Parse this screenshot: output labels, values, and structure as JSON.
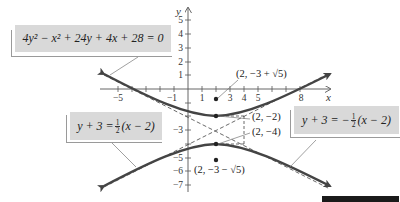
{
  "diagram": {
    "type": "hyperbola-graph",
    "equation": "4y² − x² + 24y + 4x + 28 = 0",
    "axes": {
      "x_label": "x",
      "y_label": "y",
      "x_ticks": [
        "−5",
        "−1",
        "1",
        "3",
        "4",
        "5",
        "8"
      ],
      "y_ticks": [
        "5",
        "4",
        "3",
        "2",
        "1",
        "−3",
        "−5",
        "−6",
        "−7"
      ]
    },
    "center": [
      2,
      -3
    ],
    "vertices": [
      {
        "label": "(2, −2)",
        "x": 2,
        "y": -2
      },
      {
        "label": "(2, −4)",
        "x": 2,
        "y": -4
      }
    ],
    "foci": [
      {
        "label": "(2, −3 + √5)",
        "x": 2,
        "y": -0.764
      },
      {
        "label": "(2, −3 − √5)",
        "x": 2,
        "y": -5.236
      }
    ],
    "asymptotes": {
      "left": {
        "lhs": "y + 3 =",
        "num": "1",
        "den": "2",
        "rhs": "(x − 2)"
      },
      "right": {
        "lhs": "y + 3 = −",
        "num": "1",
        "den": "2",
        "rhs": "(x − 2)"
      }
    },
    "colors": {
      "curve": "#444444",
      "box_bg": "#d9d9d9",
      "axis": "#555555"
    }
  }
}
